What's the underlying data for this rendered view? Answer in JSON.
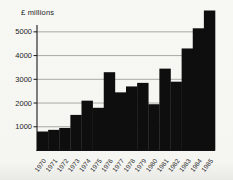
{
  "chart": {
    "unit_label": "£ millions"
  },
  "chart_data": {
    "type": "bar",
    "title": "£ millions",
    "categories": [
      "1970",
      "1971",
      "1972",
      "1973",
      "1974",
      "1975",
      "1976",
      "1977",
      "1978",
      "1979",
      "1980",
      "1981",
      "1982",
      "1983",
      "1984",
      "1985"
    ],
    "values": [
      800,
      870,
      950,
      1500,
      2100,
      1800,
      3300,
      2450,
      2700,
      2850,
      1950,
      3450,
      2900,
      4300,
      5150,
      5900
    ],
    "xlabel": "",
    "ylabel": "£ millions",
    "ylim": [
      0,
      5900
    ],
    "yticks": [
      1000,
      2000,
      3000,
      4000,
      5000
    ],
    "grid": true,
    "legend_position": "none",
    "bar_color": "#0e0e0e",
    "gridline_color": "#97948f",
    "axis_color": "#1a1a1a"
  }
}
